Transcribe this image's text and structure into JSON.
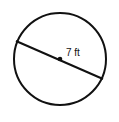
{
  "diagram": {
    "shape": "circle",
    "measure": "diameter",
    "label": "7 ft",
    "colors": {
      "stroke": "#111111",
      "background": "#ffffff"
    }
  }
}
